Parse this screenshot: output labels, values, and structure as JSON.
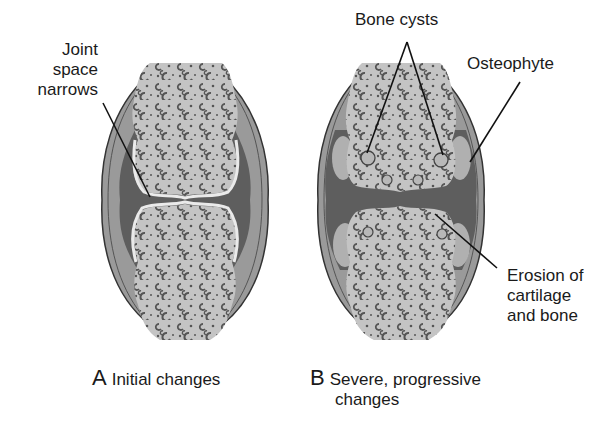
{
  "figure": {
    "panels": [
      {
        "id": "A",
        "letter": "A",
        "caption": "Initial changes",
        "labels": [
          {
            "name": "joint-space-narrows",
            "lines": [
              "Joint",
              "space",
              "narrows"
            ]
          }
        ]
      },
      {
        "id": "B",
        "letter": "B",
        "caption_line1": "Severe, progressive",
        "caption_line2": "changes",
        "labels": [
          {
            "name": "bone-cysts",
            "text": "Bone cysts"
          },
          {
            "name": "osteophyte",
            "text": "Osteophyte"
          },
          {
            "name": "erosion",
            "lines": [
              "Erosion of",
              "cartilage",
              "and bone"
            ]
          }
        ]
      }
    ],
    "colors": {
      "background": "#ffffff",
      "bone": "#c4c4c4",
      "bone_pore": "#5a5a5a",
      "joint_space": "#5e5e5e",
      "capsule": "#9a9a9a",
      "capsule_outline": "#3a3a3a",
      "cartilage": "#e8e8e8",
      "osteophyte": "#b0b0b0",
      "leader_line": "#111111"
    }
  }
}
